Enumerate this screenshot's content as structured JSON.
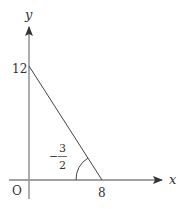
{
  "diagram": {
    "type": "coordinate-graph",
    "axes": {
      "x_label": "x",
      "y_label": "y",
      "origin_label": "O",
      "axis_color": "#999999",
      "x_axis_color": "#444444"
    },
    "line": {
      "y_intercept_label": "12",
      "x_intercept_label": "8",
      "color": "#444444"
    },
    "angle_annotation": {
      "sign": "−",
      "numerator": "3",
      "denominator": "2",
      "meaning": "slope -3/2 marked with angle arc at x-intercept"
    }
  }
}
